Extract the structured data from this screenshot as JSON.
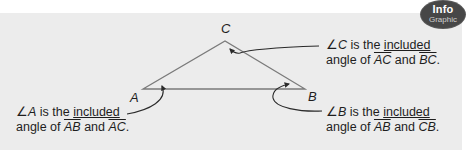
{
  "badge": {
    "line1": "Info",
    "line2": "Graphic"
  },
  "colors": {
    "panel": "#ececec",
    "badge": "#474747",
    "line": "#6e6e6e",
    "text": "#1e1e1e"
  },
  "triangle": {
    "vertices": {
      "A": {
        "label": "A",
        "x": 143,
        "y": 89
      },
      "B": {
        "label": "B",
        "x": 305,
        "y": 89
      },
      "C": {
        "label": "C",
        "x": 225,
        "y": 41
      }
    }
  },
  "notes": {
    "C": {
      "angle_symbol": "∠",
      "vertex": "C",
      "text1": " is the ",
      "underlined": "included",
      "text2": "angle of ",
      "seg1": "AC",
      "and": " and ",
      "seg2": "BC",
      "end": "."
    },
    "A": {
      "angle_symbol": "∠",
      "vertex": "A",
      "text1": " is the ",
      "underlined": "included",
      "text2": "angle of ",
      "seg1": "AB",
      "and": " and ",
      "seg2": "AC",
      "end": "."
    },
    "B": {
      "angle_symbol": "∠",
      "vertex": "B",
      "text1": " is the ",
      "underlined": "included",
      "text2": "angle of ",
      "seg1": "AB",
      "and": " and ",
      "seg2": "CB",
      "end": "."
    }
  }
}
